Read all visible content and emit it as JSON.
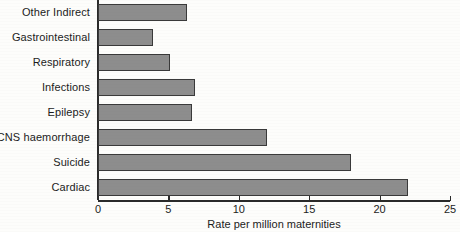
{
  "chart_data": {
    "type": "bar",
    "orientation": "horizontal",
    "title": "",
    "xlabel": "Rate per million maternities",
    "ylabel": "",
    "categories": [
      "Other Indirect",
      "Gastrointestinal",
      "Respiratory",
      "Infections",
      "Epilepsy",
      "CNS haemorrhage",
      "Suicide",
      "Cardiac"
    ],
    "values": [
      6.3,
      3.9,
      5.1,
      6.9,
      6.7,
      12.0,
      18.0,
      22.0
    ],
    "xlim": [
      0,
      25
    ],
    "xticks": [
      0,
      5,
      10,
      15,
      20,
      25
    ],
    "xtick_labels": [
      "0",
      "5",
      "10",
      "15",
      "20",
      "25"
    ],
    "grid": false,
    "legend": null,
    "bar_color": "#8d8d8d",
    "bar_edge_color": "#3a3a3a",
    "axis_color": "#2a2a2a",
    "background_color": "#fdfdfb"
  }
}
